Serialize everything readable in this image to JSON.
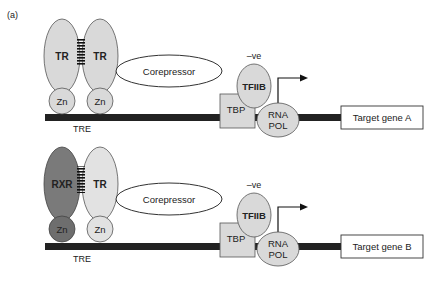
{
  "figure_label": "(a)",
  "colors": {
    "light_protein": "#d9d9d9",
    "dark_protein": "#7a7a7a",
    "dark_zn": "#6e6e6e",
    "outline": "#555555",
    "dna": "#222222",
    "box_fill": "#ffffff"
  },
  "panel_a": {
    "left_receptor": "TR",
    "right_receptor": "TR",
    "left_zn": "Zn",
    "right_zn": "Zn",
    "element": "TRE",
    "corepressor": "Corepressor",
    "negative_label": "–ve",
    "tfiib": "TFIIB",
    "tbp": "TBP",
    "rna_pol_line1": "RNA",
    "rna_pol_line2": "POL",
    "target_gene": "Target gene A"
  },
  "panel_b": {
    "left_receptor": "RXR",
    "right_receptor": "TR",
    "left_zn": "Zn",
    "right_zn": "Zn",
    "element": "TRE",
    "corepressor": "Corepressor",
    "negative_label": "–ve",
    "tfiib": "TFIIB",
    "tbp": "TBP",
    "rna_pol_line1": "RNA",
    "rna_pol_line2": "POL",
    "target_gene": "Target gene B"
  }
}
